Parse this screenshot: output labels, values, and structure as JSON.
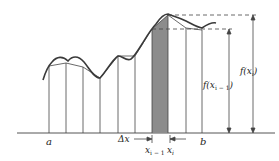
{
  "diagram": {
    "type": "riemann-trapezoid-approximation",
    "labels": {
      "a": "a",
      "b": "b",
      "delta_x": "Δx",
      "x_im1_base": "x",
      "x_im1_sub": "i − 1",
      "x_i_base": "x",
      "x_i_sub": "i",
      "f_xi": "f(x",
      "f_xi_sub": "i",
      "f_xi_close": ")",
      "f_xim1": "f(x",
      "f_xim1_sub": "i − 1",
      "f_xim1_close": ")"
    },
    "colors": {
      "stroke": "#333333",
      "shade": "#8c8c8c",
      "curve": "#3a3a3a"
    },
    "partition_x": [
      49,
      66,
      83,
      100,
      118,
      135,
      152,
      170,
      186,
      202
    ]
  }
}
